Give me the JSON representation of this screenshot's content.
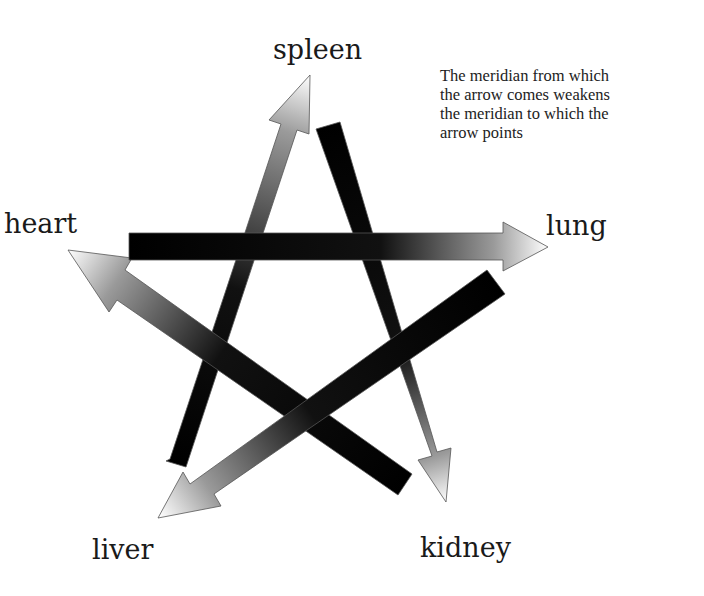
{
  "labels": {
    "spleen": "spleen",
    "heart": "heart",
    "lung": "lung",
    "liver": "liver",
    "kidney": "kidney"
  },
  "note": {
    "lines": [
      "The meridian from which",
      "the arrow comes weakens",
      "the meridian to which the",
      "arrow points"
    ]
  },
  "arrows": [
    {
      "from": "liver",
      "to": "spleen"
    },
    {
      "from": "spleen",
      "to": "kidney"
    },
    {
      "from": "kidney",
      "to": "heart"
    },
    {
      "from": "heart",
      "to": "lung"
    },
    {
      "from": "lung",
      "to": "liver"
    }
  ],
  "colors": {
    "shaft": "#000000",
    "tip": "#ffffff",
    "outline": "#555555"
  }
}
